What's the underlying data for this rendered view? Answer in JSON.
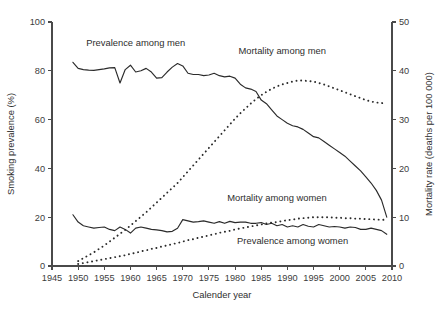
{
  "chart_data": {
    "type": "line",
    "title": "",
    "xlabel": "Calender year",
    "ylabel": "Smoking prevalence (%)",
    "y2label": "Mortality rate (deaths per 100 000)",
    "xlim": [
      1945,
      2010
    ],
    "ylim": [
      0,
      100
    ],
    "y2lim": [
      0,
      50
    ],
    "xticks": [
      1945,
      1950,
      1955,
      1960,
      1965,
      1970,
      1975,
      1980,
      1985,
      1990,
      1995,
      2000,
      2005,
      2010
    ],
    "yticks": [
      0,
      20,
      40,
      60,
      80,
      100
    ],
    "y2ticks": [
      0,
      10,
      20,
      30,
      40,
      50
    ],
    "grid": false,
    "legend_position": "inline-annotations",
    "annotations": [
      {
        "text": "Prevalence among men",
        "x": 1961,
        "y": 90,
        "axis": "left"
      },
      {
        "text": "Mortality among men",
        "x": 1989,
        "y": 87,
        "axis": "left"
      },
      {
        "text": "Mortality among women",
        "x": 1988,
        "y": 26.5,
        "axis": "left"
      },
      {
        "text": "Prevalence among women",
        "x": 1991,
        "y": 9.0,
        "axis": "left"
      }
    ],
    "series": [
      {
        "name": "Prevalence among men",
        "axis": "left",
        "unit": "%",
        "style": "solid",
        "x": [
          1949,
          1950,
          1951,
          1952,
          1953,
          1954,
          1955,
          1956,
          1957,
          1958,
          1959,
          1960,
          1961,
          1962,
          1963,
          1964,
          1965,
          1966,
          1967,
          1968,
          1969,
          1970,
          1971,
          1972,
          1973,
          1974,
          1975,
          1976,
          1977,
          1978,
          1979,
          1980,
          1981,
          1982,
          1983,
          1984,
          1985,
          1986,
          1987,
          1988,
          1989,
          1990,
          1991,
          1992,
          1993,
          1994,
          1995,
          1996,
          1997,
          1998,
          1999,
          2000,
          2001,
          2002,
          2003,
          2004,
          2005,
          2006,
          2007,
          2008,
          2009
        ],
        "values": [
          83.5,
          81.0,
          80.5,
          80.3,
          80.2,
          80.5,
          80.8,
          81.2,
          81.3,
          75.0,
          80.5,
          82.3,
          79.5,
          80.0,
          81.0,
          79.5,
          77.0,
          77.2,
          79.5,
          81.5,
          83.0,
          82.0,
          79.0,
          78.5,
          78.5,
          78.0,
          78.3,
          79.0,
          78.0,
          77.5,
          77.8,
          77.0,
          74.5,
          73.0,
          72.5,
          71.5,
          68.0,
          66.5,
          64.0,
          61.5,
          60.0,
          58.5,
          57.5,
          57.0,
          56.0,
          54.5,
          53.0,
          52.5,
          51.0,
          49.5,
          48.0,
          46.5,
          45.0,
          43.0,
          41.0,
          39.0,
          36.5,
          34.0,
          31.0,
          27.0,
          20.0
        ]
      },
      {
        "name": "Prevalence among women",
        "axis": "left",
        "unit": "%",
        "style": "solid",
        "x": [
          1949,
          1950,
          1951,
          1952,
          1953,
          1954,
          1955,
          1956,
          1957,
          1958,
          1959,
          1960,
          1961,
          1962,
          1963,
          1964,
          1965,
          1966,
          1967,
          1968,
          1969,
          1970,
          1971,
          1972,
          1973,
          1974,
          1975,
          1976,
          1977,
          1978,
          1979,
          1980,
          1981,
          1982,
          1983,
          1984,
          1985,
          1986,
          1987,
          1988,
          1989,
          1990,
          1991,
          1992,
          1993,
          1994,
          1995,
          1996,
          1997,
          1998,
          1999,
          2000,
          2001,
          2002,
          2003,
          2004,
          2005,
          2006,
          2007,
          2008,
          2009
        ],
        "values": [
          21.0,
          18.0,
          16.5,
          16.0,
          15.5,
          15.8,
          16.0,
          15.0,
          14.5,
          16.0,
          15.0,
          13.5,
          15.5,
          16.0,
          15.5,
          15.0,
          14.8,
          14.5,
          14.0,
          14.2,
          15.5,
          19.0,
          18.5,
          18.0,
          18.2,
          18.5,
          18.0,
          17.5,
          18.2,
          17.5,
          18.3,
          17.8,
          18.0,
          18.0,
          17.5,
          17.5,
          17.8,
          17.0,
          17.5,
          16.5,
          17.0,
          16.0,
          16.5,
          16.0,
          17.0,
          16.3,
          16.0,
          17.0,
          16.5,
          16.0,
          16.2,
          16.0,
          15.5,
          16.0,
          15.8,
          15.0,
          15.0,
          15.5,
          15.0,
          14.5,
          13.0
        ]
      },
      {
        "name": "Mortality among men",
        "axis": "right",
        "unit": "deaths per 100 000",
        "style": "dotted",
        "x": [
          1950,
          1951,
          1952,
          1953,
          1954,
          1955,
          1956,
          1957,
          1958,
          1959,
          1960,
          1961,
          1962,
          1963,
          1964,
          1965,
          1966,
          1967,
          1968,
          1969,
          1970,
          1971,
          1972,
          1973,
          1974,
          1975,
          1976,
          1977,
          1978,
          1979,
          1980,
          1981,
          1982,
          1983,
          1984,
          1985,
          1986,
          1987,
          1988,
          1989,
          1990,
          1991,
          1992,
          1993,
          1994,
          1995,
          1996,
          1997,
          1998,
          1999,
          2000,
          2001,
          2002,
          2003,
          2004,
          2005,
          2006,
          2007,
          2008,
          2009
        ],
        "values": [
          1.0,
          1.6,
          2.2,
          2.8,
          3.5,
          4.2,
          5.0,
          5.8,
          6.6,
          7.4,
          8.3,
          9.2,
          10.1,
          11.0,
          12.0,
          13.0,
          14.0,
          15.0,
          16.0,
          17.0,
          18.2,
          19.4,
          20.6,
          21.8,
          23.0,
          24.2,
          25.4,
          26.6,
          27.8,
          29.0,
          30.2,
          31.3,
          32.3,
          33.3,
          34.2,
          35.0,
          35.7,
          36.3,
          36.8,
          37.2,
          37.5,
          37.8,
          38.0,
          38.0,
          37.9,
          37.8,
          37.5,
          37.2,
          36.8,
          36.4,
          36.0,
          35.6,
          35.2,
          34.8,
          34.4,
          34.0,
          33.7,
          33.5,
          33.4,
          33.3
        ]
      },
      {
        "name": "Mortality among women",
        "axis": "right",
        "unit": "deaths per 100 000",
        "style": "dotted",
        "x": [
          1950,
          1951,
          1952,
          1953,
          1954,
          1955,
          1956,
          1957,
          1958,
          1959,
          1960,
          1961,
          1962,
          1963,
          1964,
          1965,
          1966,
          1967,
          1968,
          1969,
          1970,
          1971,
          1972,
          1973,
          1974,
          1975,
          1976,
          1977,
          1978,
          1979,
          1980,
          1981,
          1982,
          1983,
          1984,
          1985,
          1986,
          1987,
          1988,
          1989,
          1990,
          1991,
          1992,
          1993,
          1994,
          1995,
          1996,
          1997,
          1998,
          1999,
          2000,
          2001,
          2002,
          2003,
          2004,
          2005,
          2006,
          2007,
          2008,
          2009
        ],
        "values": [
          0.4,
          0.6,
          0.8,
          1.0,
          1.2,
          1.4,
          1.6,
          1.8,
          2.0,
          2.2,
          2.5,
          2.7,
          3.0,
          3.2,
          3.5,
          3.7,
          4.0,
          4.2,
          4.5,
          4.7,
          5.0,
          5.3,
          5.5,
          5.8,
          6.0,
          6.3,
          6.5,
          6.8,
          7.0,
          7.2,
          7.5,
          7.7,
          7.9,
          8.1,
          8.3,
          8.5,
          8.7,
          8.9,
          9.0,
          9.2,
          9.4,
          9.5,
          9.7,
          9.8,
          9.9,
          10.0,
          10.0,
          10.0,
          10.0,
          9.9,
          9.9,
          9.8,
          9.8,
          9.7,
          9.7,
          9.6,
          9.6,
          9.5,
          9.5,
          9.4
        ]
      }
    ]
  },
  "colors": {
    "axis": "#4a4a4a",
    "text": "#3c3c3c",
    "series": "#2b2b2b",
    "background": "#ffffff"
  }
}
